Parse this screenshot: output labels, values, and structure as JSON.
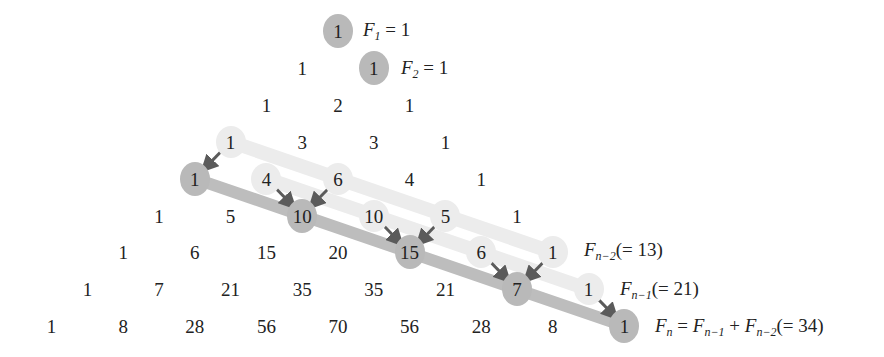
{
  "diagram": {
    "layout": {
      "center_x": 338,
      "col_step": 35.8,
      "row_top": 31,
      "row_step": 36.9
    },
    "colors": {
      "dark_circle": "#b9b9b9",
      "light_circle": "#ececec",
      "dark_band": "#bdbdbd",
      "light_band": "#ececec",
      "arrow": "#5b5b5b",
      "text": "#222222"
    },
    "rows": [
      [
        "1"
      ],
      [
        "1",
        "1"
      ],
      [
        "1",
        "2",
        "1"
      ],
      [
        "1",
        "3",
        "3",
        "1"
      ],
      [
        "1",
        "4",
        "6",
        "4",
        "1"
      ],
      [
        "1",
        "5",
        "10",
        "10",
        "5",
        "1"
      ],
      [
        "1",
        "6",
        "15",
        "20",
        "15",
        "6",
        "1"
      ],
      [
        "1",
        "7",
        "21",
        "35",
        "35",
        "21",
        "7",
        "1"
      ],
      [
        "1",
        "8",
        "28",
        "56",
        "70",
        "56",
        "28",
        "8",
        "1"
      ]
    ],
    "highlights": {
      "dark": [
        [
          0,
          0
        ],
        [
          1,
          1
        ],
        [
          4,
          0
        ],
        [
          5,
          2
        ],
        [
          6,
          4
        ],
        [
          7,
          6
        ],
        [
          8,
          8
        ]
      ],
      "light": [
        [
          3,
          0
        ],
        [
          4,
          1
        ],
        [
          4,
          2
        ],
        [
          5,
          3
        ],
        [
          5,
          4
        ],
        [
          6,
          5
        ],
        [
          6,
          6
        ],
        [
          7,
          7
        ]
      ]
    },
    "bands": {
      "dark": [
        [
          4,
          0
        ],
        [
          5,
          2
        ],
        [
          6,
          4
        ],
        [
          7,
          6
        ],
        [
          8,
          8
        ]
      ],
      "light_n2": [
        [
          3,
          0
        ],
        [
          4,
          2
        ],
        [
          5,
          4
        ],
        [
          6,
          6
        ]
      ],
      "light_n1": [
        [
          4,
          1
        ],
        [
          5,
          3
        ],
        [
          6,
          5
        ],
        [
          7,
          7
        ]
      ]
    },
    "arrows": [
      [
        [
          3,
          0
        ],
        [
          4,
          0
        ]
      ],
      [
        [
          4,
          1
        ],
        [
          5,
          2
        ]
      ],
      [
        [
          4,
          2
        ],
        [
          5,
          2
        ]
      ],
      [
        [
          5,
          3
        ],
        [
          6,
          4
        ]
      ],
      [
        [
          5,
          4
        ],
        [
          6,
          4
        ]
      ],
      [
        [
          6,
          5
        ],
        [
          7,
          6
        ]
      ],
      [
        [
          6,
          6
        ],
        [
          7,
          6
        ]
      ],
      [
        [
          7,
          7
        ],
        [
          8,
          8
        ]
      ]
    ],
    "labels": {
      "f1": {
        "row": 0,
        "text": "F",
        "sub": "1",
        "rest": " = 1"
      },
      "f2": {
        "row": 1,
        "text": "F",
        "sub": "2",
        "rest": " = 1"
      },
      "fn2": {
        "row": 6,
        "text": "F",
        "sub": "n−2",
        "rest": "(= 13)"
      },
      "fn1": {
        "row": 7,
        "text": "F",
        "sub": "n−1",
        "rest": "(= 21)"
      },
      "fn": {
        "row": 8,
        "text": "F",
        "sub": "n",
        "eq": " = ",
        "t2": "F",
        "sub2": "n−1",
        "plus": " + ",
        "t3": "F",
        "sub3": "n−2",
        "rest": "(= 34)"
      }
    }
  }
}
